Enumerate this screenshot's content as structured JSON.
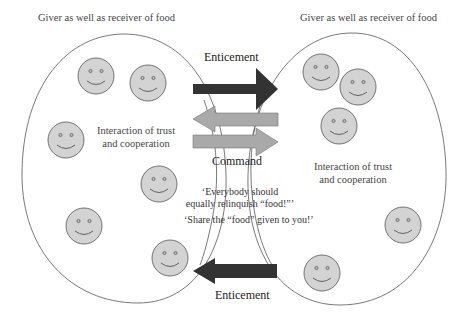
{
  "colors": {
    "ellipse_stroke": "#555555",
    "face_fill": "#d3d3d3",
    "face_stroke": "#555555",
    "dark_arrow": "#333333",
    "grey_arrow": "#a9a9a9",
    "background": "#ffffff"
  },
  "left_group": {
    "header": "Giver as well as receiver of food",
    "interaction_line1": "Interaction of trust",
    "interaction_line2": "and cooperation",
    "faces": [
      {
        "cx": 96,
        "cy": 76
      },
      {
        "cx": 148,
        "cy": 83
      },
      {
        "cx": 66,
        "cy": 140
      },
      {
        "cx": 159,
        "cy": 184
      },
      {
        "cx": 84,
        "cy": 226
      },
      {
        "cx": 170,
        "cy": 258
      }
    ]
  },
  "right_group": {
    "header": "Giver as well as receiver of food",
    "interaction_line1": "Interaction of trust",
    "interaction_line2": "and cooperation",
    "faces": [
      {
        "cx": 321,
        "cy": 72
      },
      {
        "cx": 358,
        "cy": 87
      },
      {
        "cx": 339,
        "cy": 126
      },
      {
        "cx": 403,
        "cy": 225
      },
      {
        "cx": 322,
        "cy": 273
      }
    ]
  },
  "arrows": {
    "top_label": "Enticement",
    "middle_label": "Command",
    "bottom_label": "Enticement"
  },
  "quotes": {
    "line1": "‘Everybody should",
    "line2": "equally relinquish “food!”’",
    "line3": "‘Share the “food” given to you!’"
  }
}
